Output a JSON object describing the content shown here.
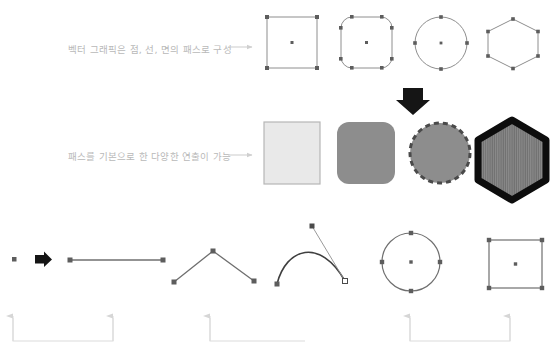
{
  "page": {
    "background": "#ffffff",
    "width": 556,
    "height": 357
  },
  "colors": {
    "caption_text": "#b9b9b9",
    "arrow_light": "#cfcfcf",
    "path_stroke": "#6f6f6f",
    "anchor_fill": "#5d5d5d",
    "shape_outline": "#8e8e8e",
    "fill_light_gray": "#e8e8e8",
    "fill_mid_gray": "#8a8a8a",
    "fill_dark_stripe": "#6a6a6a",
    "black": "#0d0d0d",
    "bracket_gray": "#d8d8d8"
  },
  "captions": [
    {
      "id": "caption-vector-composition",
      "text": "벡터 그래픽은 점, 선, 면의 패스로 구성"
    },
    {
      "id": "caption-path-expression",
      "text": "패스를 기본으로 한 다양한 연출이 가능"
    }
  ],
  "row_outline_shapes": {
    "label": "Outline path shapes with anchor points",
    "items": [
      {
        "name": "square-path",
        "anchors": 4,
        "center_point": true
      },
      {
        "name": "rounded-square-path",
        "anchors": 8,
        "center_point": true
      },
      {
        "name": "circle-path",
        "anchors": 4,
        "center_point": true
      },
      {
        "name": "hexagon-path",
        "anchors": 6,
        "center_point": false
      }
    ]
  },
  "transition": {
    "name": "down-arrow",
    "direction": "down"
  },
  "row_filled_shapes": {
    "label": "Styled filled shapes rendered from paths",
    "items": [
      {
        "name": "square-fill-light",
        "style": "light gray fill, thin outline"
      },
      {
        "name": "rounded-square-fill-gray",
        "style": "mid gray solid fill"
      },
      {
        "name": "scalloped-circle-fill",
        "style": "gray fill, dashed scalloped edge"
      },
      {
        "name": "hexagon-fill-striped",
        "style": "thick black outline, vertical stripe fill"
      }
    ]
  },
  "row_path_primitives": {
    "label": "Path primitive examples",
    "items": [
      {
        "name": "single-point",
        "description": "single anchor point"
      },
      {
        "name": "point-to-line-arrow",
        "description": "right arrow"
      },
      {
        "name": "straight-line-path",
        "description": "straight segment with two anchors"
      },
      {
        "name": "angular-polyline-path",
        "description": "zigzag corner path with three anchors"
      },
      {
        "name": "bezier-curve-path",
        "description": "curve with visible control handle"
      },
      {
        "name": "circle-closed-path",
        "description": "closed circle with four anchors and center"
      },
      {
        "name": "square-closed-path",
        "description": "closed square with four anchors and center"
      }
    ]
  },
  "brackets": {
    "label": "Grouping brackets with upward arrows",
    "items": [
      {
        "name": "bracket-point",
        "arrows": 2
      },
      {
        "name": "bracket-line",
        "arrows": 1
      },
      {
        "name": "bracket-surface",
        "arrows": 2
      }
    ]
  }
}
